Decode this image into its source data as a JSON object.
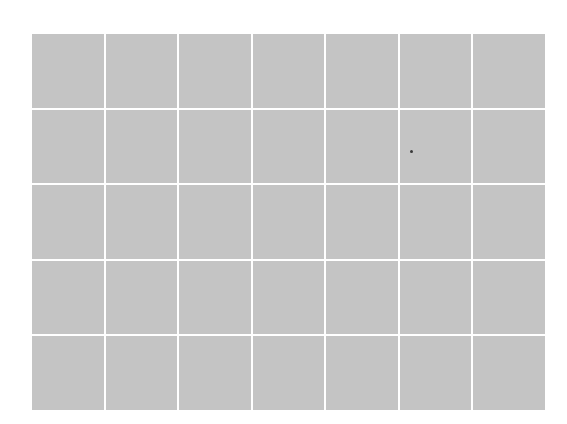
{
  "grid": {
    "rows": 5,
    "columns": 7,
    "cell_color": "#c4c4c4",
    "line_color": "#ffffff",
    "background": "#ffffff"
  },
  "marker": {
    "x": 411,
    "y": 151,
    "color": "#3a3a3a"
  }
}
